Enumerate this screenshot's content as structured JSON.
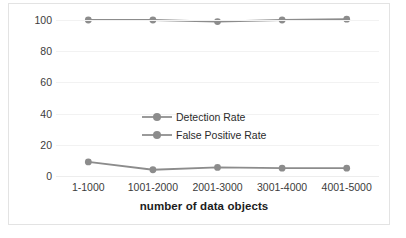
{
  "chart_data": {
    "type": "line",
    "title": "",
    "xlabel": "number of data objects",
    "ylabel": "",
    "categories": [
      "1-1000",
      "1001-2000",
      "2001-3000",
      "3001-4000",
      "4001-5000"
    ],
    "yticks": [
      100,
      80,
      60,
      40,
      20,
      0
    ],
    "ylim": [
      0,
      100
    ],
    "grid": true,
    "legend_position": "inside-center-left",
    "series": [
      {
        "name": "Detection Rate",
        "values": [
          100,
          100,
          99,
          100,
          100.5
        ],
        "color": "#8c8c8c",
        "marker": "circle"
      },
      {
        "name": "False Positive Rate",
        "values": [
          9,
          4,
          5.5,
          5,
          5
        ],
        "color": "#8c8c8c",
        "marker": "circle"
      }
    ]
  },
  "legend": {
    "items": [
      {
        "label": "Detection Rate"
      },
      {
        "label": "False Positive Rate"
      }
    ]
  },
  "colors": {
    "series": "#8c8c8c",
    "gridline": "#f2f2f2",
    "border": "#e3e3e3",
    "text": "#3b3b3b",
    "title_text": "#1c1c1c"
  }
}
